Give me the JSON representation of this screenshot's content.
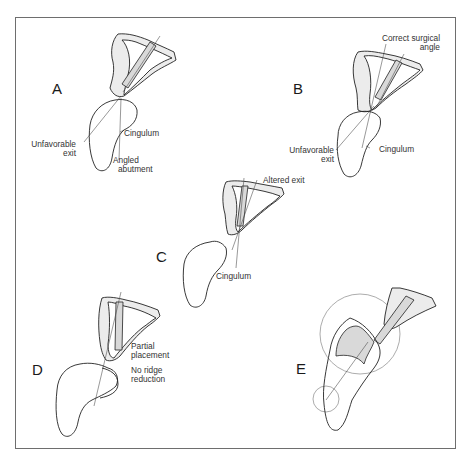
{
  "figure": {
    "panels": [
      {
        "id": "A",
        "letter": "A",
        "labels": {
          "unfavorable_exit_1": "Unfavorable",
          "unfavorable_exit_2": "exit",
          "cingulum": "Cingulum",
          "angled_abutment_1": "Angled",
          "angled_abutment_2": "abutment"
        }
      },
      {
        "id": "B",
        "letter": "B",
        "labels": {
          "correct_angle_1": "Correct surgical",
          "correct_angle_2": "angle",
          "unfavorable_exit_1": "Unfavorable",
          "unfavorable_exit_2": "exit",
          "cingulum": "Cingulum"
        }
      },
      {
        "id": "C",
        "letter": "C",
        "labels": {
          "altered_exit": "Altered exit",
          "cingulum": "Cingulum"
        }
      },
      {
        "id": "D",
        "letter": "D",
        "labels": {
          "partial_placement_1": "Partial",
          "partial_placement_2": "placement",
          "no_ridge_1": "No ridge",
          "no_ridge_2": "reduction"
        }
      },
      {
        "id": "E",
        "letter": "E",
        "labels": {}
      }
    ],
    "colors": {
      "frame": "#6e6e6e",
      "line": "#222222",
      "implant_shade": "#d9d9d9",
      "bone_fill": "#ececec"
    }
  }
}
